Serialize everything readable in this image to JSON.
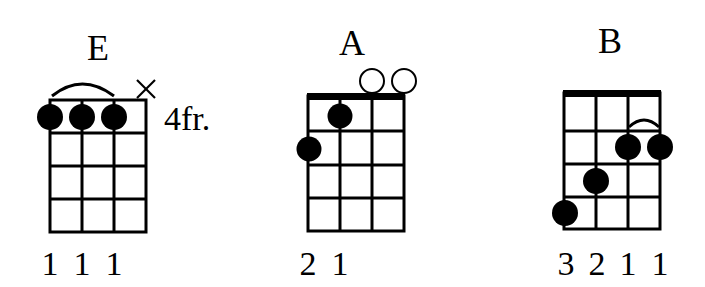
{
  "chords": [
    {
      "name": "E",
      "position_label": "4fr.",
      "fingering": [
        "1",
        "1",
        "1"
      ],
      "muted_strings": [
        4
      ],
      "open_strings": [],
      "barre": {
        "from_string": 1,
        "to_string": 3,
        "fret": 1
      },
      "dots": [
        {
          "string": 1,
          "fret": 1
        },
        {
          "string": 2,
          "fret": 1
        },
        {
          "string": 3,
          "fret": 1
        }
      ],
      "nut": false
    },
    {
      "name": "A",
      "position_label": "",
      "fingering": [
        "2",
        "1"
      ],
      "muted_strings": [],
      "open_strings": [
        3,
        4
      ],
      "barre": null,
      "dots": [
        {
          "string": 1,
          "fret": 2
        },
        {
          "string": 2,
          "fret": 1
        }
      ],
      "nut": true
    },
    {
      "name": "B",
      "position_label": "",
      "fingering": [
        "3",
        "2",
        "1",
        "1"
      ],
      "muted_strings": [],
      "open_strings": [],
      "barre": {
        "from_string": 3,
        "to_string": 4,
        "fret": 2
      },
      "dots": [
        {
          "string": 1,
          "fret": 4
        },
        {
          "string": 2,
          "fret": 3
        },
        {
          "string": 3,
          "fret": 2
        },
        {
          "string": 4,
          "fret": 2
        }
      ],
      "nut": true
    }
  ]
}
